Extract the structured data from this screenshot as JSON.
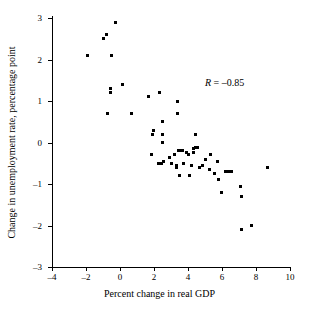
{
  "chart_data": {
    "type": "scatter",
    "title": "",
    "xlabel": "Percent change in real GDP",
    "ylabel": "Change in unemployment rate, percentage point",
    "xlim": [
      -4,
      10
    ],
    "ylim": [
      -3,
      3
    ],
    "xticks": [
      -4,
      -2,
      0,
      2,
      4,
      6,
      8,
      10
    ],
    "xtick_labels": [
      "-4",
      "-2",
      "0",
      "2",
      "4",
      "6",
      "8",
      "10"
    ],
    "yticks": [
      -3,
      -2,
      -1,
      0,
      1,
      2,
      3
    ],
    "ytick_labels": [
      "-3",
      "-2",
      "-1",
      "0",
      "1",
      "2",
      "3"
    ],
    "grid": false,
    "legend": null,
    "annotations": [
      {
        "text_symbol": "R",
        "text_value": " = –0.85",
        "x": 6.0,
        "y": 1.45
      }
    ],
    "series": [
      {
        "name": "GDP growth vs unemployment change",
        "marker": "square",
        "color": "#000000",
        "points": [
          [
            -1.9,
            2.1
          ],
          [
            -1.0,
            2.5
          ],
          [
            -0.8,
            2.6
          ],
          [
            -0.5,
            2.1
          ],
          [
            -0.25,
            2.9
          ],
          [
            -0.55,
            1.3
          ],
          [
            -0.55,
            1.2
          ],
          [
            0.15,
            1.4
          ],
          [
            -0.75,
            0.7
          ],
          [
            0.7,
            0.7
          ],
          [
            1.65,
            1.1
          ],
          [
            2.3,
            1.2
          ],
          [
            3.4,
            1.0
          ],
          [
            3.4,
            0.7
          ],
          [
            2.5,
            0.5
          ],
          [
            1.95,
            0.3
          ],
          [
            1.9,
            0.2
          ],
          [
            2.5,
            0.2
          ],
          [
            2.5,
            0.0
          ],
          [
            4.45,
            0.2
          ],
          [
            1.85,
            -0.3
          ],
          [
            2.25,
            -0.5
          ],
          [
            2.45,
            -0.5
          ],
          [
            2.55,
            -0.45
          ],
          [
            2.9,
            -0.35
          ],
          [
            3.05,
            -0.5
          ],
          [
            3.2,
            -0.3
          ],
          [
            3.3,
            -0.55
          ],
          [
            3.45,
            -0.2
          ],
          [
            3.55,
            -0.2
          ],
          [
            3.65,
            -0.2
          ],
          [
            3.5,
            -0.8
          ],
          [
            3.35,
            -0.6
          ],
          [
            3.75,
            -0.5
          ],
          [
            3.9,
            -0.25
          ],
          [
            4.05,
            -0.3
          ],
          [
            4.1,
            -0.8
          ],
          [
            4.2,
            -0.55
          ],
          [
            4.3,
            -0.25
          ],
          [
            4.35,
            -0.15
          ],
          [
            4.45,
            -0.12
          ],
          [
            4.55,
            -0.12
          ],
          [
            4.7,
            -0.6
          ],
          [
            4.85,
            -0.55
          ],
          [
            5.0,
            -0.4
          ],
          [
            5.25,
            -0.65
          ],
          [
            5.35,
            -0.3
          ],
          [
            5.55,
            -0.75
          ],
          [
            5.75,
            -0.45
          ],
          [
            5.8,
            -0.9
          ],
          [
            5.95,
            -1.2
          ],
          [
            6.2,
            -0.7
          ],
          [
            6.4,
            -0.7
          ],
          [
            6.55,
            -0.7
          ],
          [
            7.1,
            -1.05
          ],
          [
            7.15,
            -1.3
          ],
          [
            7.15,
            -2.1
          ],
          [
            7.75,
            -2.0
          ],
          [
            8.7,
            -0.6
          ]
        ]
      }
    ]
  },
  "caption": ""
}
